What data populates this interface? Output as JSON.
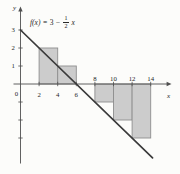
{
  "chart_data": {
    "type": "line",
    "formula": {
      "fx": "f(x)",
      "mid": "= 3 −",
      "num": "1",
      "den": "2",
      "var": "x"
    },
    "function_line": {
      "x": [
        0,
        14.2
      ],
      "y": [
        3,
        -4.1
      ]
    },
    "x_axis": {
      "label": "x",
      "ticks": [
        2,
        4,
        6,
        8,
        10,
        12,
        14
      ],
      "labels_below_axis": [
        2,
        4,
        6
      ],
      "labels_above_axis": [
        8,
        10,
        12,
        14
      ],
      "origin_label": "0",
      "range": [
        0,
        16.2
      ]
    },
    "y_axis": {
      "label": "y",
      "labeled_ticks": [
        1,
        2,
        3
      ],
      "unlabeled_ticks": [
        -1,
        -2,
        -3
      ],
      "range": [
        -4.4,
        4.1
      ]
    },
    "riemann_rects": [
      {
        "x0": 2,
        "x1": 4,
        "y": 2
      },
      {
        "x0": 4,
        "x1": 6,
        "y": 1
      },
      {
        "x0": 8,
        "x1": 10,
        "y": -1
      },
      {
        "x0": 10,
        "x1": 12,
        "y": -2
      },
      {
        "x0": 12,
        "x1": 14,
        "y": -3
      }
    ],
    "colors": {
      "background": "#fcfcfa",
      "rect_fill": "#cccccc",
      "rect_stroke": "#8e8e8e",
      "line": "#3a3a3a",
      "axis": "#4f4f4f",
      "text": "#262626"
    }
  }
}
